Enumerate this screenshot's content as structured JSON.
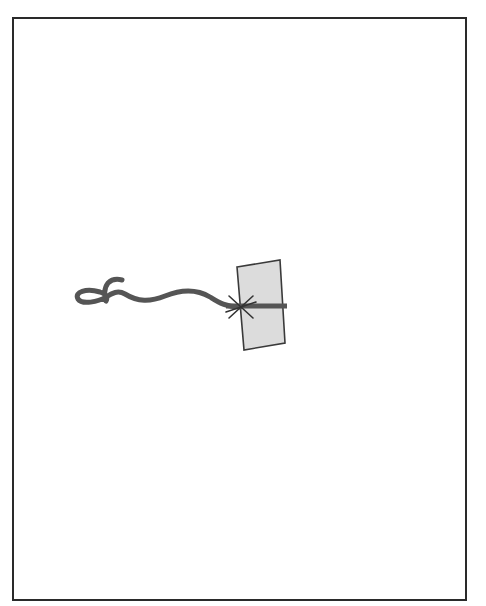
{
  "diagram": {
    "frame": {
      "border_color": "#2a2a2a",
      "background": "#ffffff"
    },
    "cord": {
      "color": "#555555",
      "description": "wavy cord with a loop knot at the left end"
    },
    "card": {
      "fill": "#dcdcdc",
      "stroke": "#3a3a3a",
      "description": "tilted rectangular tag"
    },
    "bar": {
      "color": "#555555"
    },
    "attachment_point": {
      "icon": "asterisk-star-icon",
      "color": "#333333"
    }
  }
}
